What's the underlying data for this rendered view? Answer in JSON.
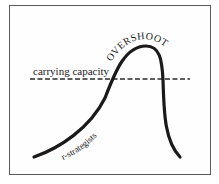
{
  "diagram": {
    "labels": {
      "carrying_capacity": "carrying capacity",
      "overshoot": "OVERSHOOT",
      "r_strategists": "r-strategists"
    },
    "colors": {
      "curve": "#1a1a1a",
      "dashed_line": "#2a2a2a",
      "frame": "#5a5a5a",
      "background": "#ffffff"
    }
  }
}
